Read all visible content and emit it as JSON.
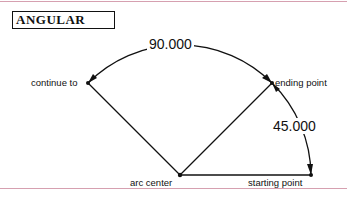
{
  "title": "ANGULAR",
  "dimensions": {
    "arc_angle": "90.000",
    "start_angle": "45.000"
  },
  "labels": {
    "continue_to": "continue to",
    "ending_point": "ending point",
    "arc_center": "arc center",
    "starting_point": "starting point"
  },
  "colors": {
    "line": "#111111",
    "rule": "#d6a0b0"
  }
}
